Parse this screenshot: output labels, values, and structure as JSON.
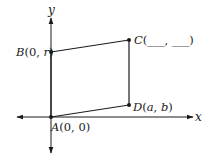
{
  "diagram": {
    "type": "coordinate-plane-quadrilateral",
    "axes": {
      "x_label": "x",
      "y_label": "y"
    },
    "points": {
      "A": {
        "label": "A(0, 0)",
        "name": "A",
        "coords": "(0, 0)"
      },
      "B": {
        "label": "B(0, r)",
        "name": "B",
        "coords": "(0, r)"
      },
      "C": {
        "label": "C(___, ___)",
        "name": "C",
        "coords": "(___, ___)"
      },
      "D": {
        "label": "D(a, b)",
        "name": "D",
        "coords": "(a, b)"
      }
    },
    "segments": [
      "AB",
      "BC",
      "CD",
      "DA"
    ],
    "colors": {
      "stroke": "#1a1a1a",
      "background": "#ffffff"
    }
  }
}
